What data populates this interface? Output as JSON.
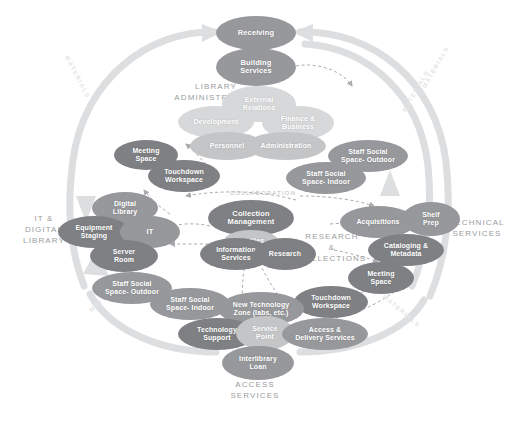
{
  "diagram": {
    "colors": {
      "node_dark": "#7e8083",
      "node_mid": "#96989b",
      "node_light": "#c3c5c7",
      "node_pale": "#d6d8d9",
      "arc": "#dcdee0",
      "dashed": "#a9abad",
      "zone_label": "#9a9c9e",
      "background": "#ffffff"
    }
  },
  "zones": [
    {
      "name": "library-administration",
      "label": "LIBRARY\nADMINISTRATION",
      "line1": "LIBRARY",
      "line2": "ADMINISTRATION"
    },
    {
      "name": "it-digital-library",
      "label": "IT &\nDIGITAL\nLIBRARY",
      "line1": "IT &",
      "line2": "DIGITAL",
      "line3": "LIBRARY"
    },
    {
      "name": "technical-services",
      "label": "TECHNICAL\nSERVICES",
      "line1": "TECHNICAL",
      "line2": "SERVICES"
    },
    {
      "name": "research-collections",
      "label": "RESEARCH\n&\nCOLLECTIONS",
      "line1": "RESEARCH",
      "line2": "&",
      "line3": "COLLECTIONS"
    },
    {
      "name": "access-services",
      "label": "ACCESS\nSERVICES",
      "line1": "ACCESS",
      "line2": "SERVICES"
    }
  ],
  "nodes": [
    {
      "id": "receiving",
      "label": "Receiving",
      "tone": "mid"
    },
    {
      "id": "building-services",
      "label": "Building\nServices",
      "tone": "mid",
      "l1": "Building",
      "l2": "Services"
    },
    {
      "id": "external-relations",
      "label": "External\nRelations",
      "tone": "pale",
      "l1": "External",
      "l2": "Relations"
    },
    {
      "id": "development",
      "label": "Development",
      "tone": "pale"
    },
    {
      "id": "finance-business",
      "label": "Finance &\nBusiness",
      "tone": "pale",
      "l1": "Finance &",
      "l2": "Business"
    },
    {
      "id": "personnel",
      "label": "Personnel",
      "tone": "light"
    },
    {
      "id": "administration",
      "label": "Administration",
      "tone": "light"
    },
    {
      "id": "meeting-space-left",
      "label": "Meeting\nSpace",
      "tone": "dark",
      "l1": "Meeting",
      "l2": "Space"
    },
    {
      "id": "touchdown-workspace-left",
      "label": "Touchdown\nWorkspace",
      "tone": "dark",
      "l1": "Touchdown",
      "l2": "Workspace"
    },
    {
      "id": "staff-social-space-outdoor-top",
      "label": "Staff Social\nSpace- Outdoor",
      "tone": "mid",
      "l1": "Staff Social",
      "l2": "Space- Outdoor"
    },
    {
      "id": "staff-social-space-indoor-top",
      "label": "Staff Social\nSpace- Indoor",
      "tone": "mid",
      "l1": "Staff Social",
      "l2": "Space- Indoor"
    },
    {
      "id": "digital-library",
      "label": "Digital\nLibrary",
      "tone": "mid",
      "l1": "Digital",
      "l2": "Library"
    },
    {
      "id": "equipment-staging",
      "label": "Equipment\nStaging",
      "tone": "dark",
      "l1": "Equipment",
      "l2": "Staging"
    },
    {
      "id": "it",
      "label": "IT",
      "tone": "mid"
    },
    {
      "id": "server-room",
      "label": "Server\nRoom",
      "tone": "dark",
      "l1": "Server",
      "l2": "Room"
    },
    {
      "id": "staff-social-space-outdoor-left",
      "label": "Staff Social\nSpace- Outdoor",
      "tone": "mid",
      "l1": "Staff Social",
      "l2": "Space- Outdoor"
    },
    {
      "id": "staff-social-space-indoor-left",
      "label": "Staff Social\nSpace- Indoor",
      "tone": "mid",
      "l1": "Staff Social",
      "l2": "Space- Indoor"
    },
    {
      "id": "collection-management",
      "label": "Collection\nManagement",
      "tone": "dark",
      "l1": "Collection",
      "l2": "Management"
    },
    {
      "id": "textiles",
      "label": "Textiles",
      "tone": "light"
    },
    {
      "id": "information-services",
      "label": "Information\nServices",
      "tone": "dark",
      "l1": "Information",
      "l2": "Services"
    },
    {
      "id": "research",
      "label": "Research",
      "tone": "dark"
    },
    {
      "id": "acquisitions",
      "label": "Acquisitions",
      "tone": "mid"
    },
    {
      "id": "shelf-prep",
      "label": "Shelf\nPrep",
      "tone": "mid",
      "l1": "Shelf",
      "l2": "Prep"
    },
    {
      "id": "cataloging-metadata",
      "label": "Cataloging &\nMetadata",
      "tone": "dark",
      "l1": "Cataloging &",
      "l2": "Metadata"
    },
    {
      "id": "meeting-space-right",
      "label": "Meeting\nSpace",
      "tone": "dark",
      "l1": "Meeting",
      "l2": "Space"
    },
    {
      "id": "touchdown-workspace-right",
      "label": "Touchdown\nWorkspace",
      "tone": "dark",
      "l1": "Touchdown",
      "l2": "Workspace"
    },
    {
      "id": "new-technology-zone",
      "label": "New Technology\nZone (labs, etc.)",
      "tone": "mid",
      "l1": "New Technology",
      "l2": "Zone (labs, etc.)"
    },
    {
      "id": "technology-support",
      "label": "Technology\nSupport",
      "tone": "dark",
      "l1": "Technology",
      "l2": "Support"
    },
    {
      "id": "service-point",
      "label": "Service\nPoint",
      "tone": "light",
      "l1": "Service",
      "l2": "Point"
    },
    {
      "id": "access-delivery-services",
      "label": "Access &\nDelivery Services",
      "tone": "mid",
      "l1": "Access &",
      "l2": "Delivery Services"
    },
    {
      "id": "interlibrary-loan",
      "label": "Interlibrary\nLoan",
      "tone": "mid",
      "l1": "Interlibrary",
      "l2": "Loan"
    }
  ],
  "arc_labels": [
    {
      "id": "materials-top-left",
      "label": "MATERIALS"
    },
    {
      "id": "materials-top-right-outer",
      "label": "MATERIALS"
    },
    {
      "id": "materials-top-right-inner",
      "label": "MATERIALS"
    },
    {
      "id": "materials-bottom-left",
      "label": "MATERIALS"
    },
    {
      "id": "materials-bottom-right",
      "label": "MATERIALS"
    }
  ],
  "flow_labels": [
    {
      "id": "collaboration",
      "label": "COLLABORATION"
    }
  ]
}
